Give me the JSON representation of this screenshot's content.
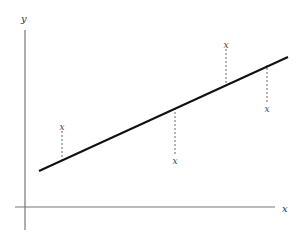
{
  "diagram": {
    "title": "",
    "axes": {
      "x_label": "x",
      "y_label": "y",
      "x_axis": {
        "x1": 15,
        "x2": 275,
        "y": 207
      },
      "y_axis": {
        "x": 25,
        "y1": 30,
        "y2": 230
      },
      "x_label_pos": {
        "x": 282,
        "y": 212
      },
      "y_label_pos": {
        "x": 21,
        "y": 22
      }
    },
    "regression_line": {
      "x1": 39,
      "y1": 171,
      "x2": 288,
      "y2": 57
    },
    "points": [
      {
        "label": "x",
        "x": 62,
        "y": 127,
        "line_y": 160
      },
      {
        "label": "x",
        "x": 175,
        "y": 161,
        "line_y": 108
      },
      {
        "label": "x",
        "x": 226,
        "y": 45,
        "line_y": 84
      },
      {
        "label": "x",
        "x": 267,
        "y": 109,
        "line_y": 65
      }
    ],
    "colors": {
      "axis": "#777777",
      "regression": "#111111",
      "residual": "#666666",
      "text": "#333333"
    }
  }
}
